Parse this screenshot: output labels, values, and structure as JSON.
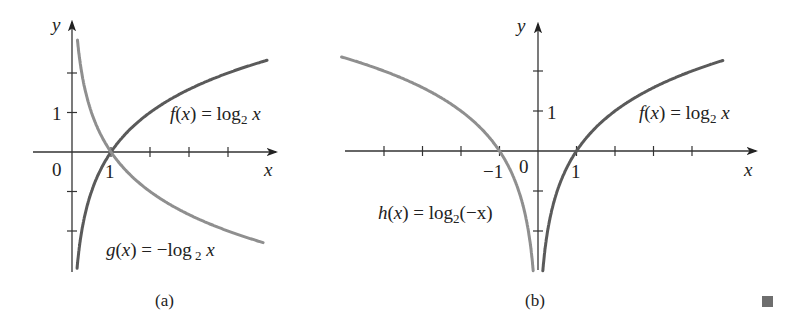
{
  "chart_data": [
    {
      "id": "a",
      "type": "line",
      "caption": "(a)",
      "xlabel": "x",
      "ylabel": "y",
      "origin_label": "0",
      "x_tick_labels": [
        {
          "x": 1,
          "label": "1"
        }
      ],
      "y_tick_labels": [
        {
          "y": 1,
          "label": "1"
        }
      ],
      "x_ticks": [
        1,
        2,
        3,
        4
      ],
      "y_ticks": [
        -2,
        -1,
        1,
        2
      ],
      "xlim": [
        -1,
        5.4
      ],
      "ylim": [
        -3,
        3
      ],
      "grid": false,
      "series": [
        {
          "name": "f(x) = log2 x",
          "expr": "log2(x)",
          "domain": [
            0.25,
            5
          ],
          "color": "#5a5a5a",
          "points": [
            [
              0.25,
              -2
            ],
            [
              0.5,
              -1
            ],
            [
              1,
              0
            ],
            [
              2,
              1
            ],
            [
              4,
              2
            ],
            [
              5,
              2.32
            ]
          ]
        },
        {
          "name": "g(x) = -log2 x",
          "expr": "-log2(x)",
          "domain": [
            0.25,
            5
          ],
          "color": "#8f8f8f",
          "points": [
            [
              0.25,
              2
            ],
            [
              0.5,
              1
            ],
            [
              1,
              0
            ],
            [
              2,
              -1
            ],
            [
              4,
              -2
            ],
            [
              5,
              -2.32
            ]
          ]
        }
      ],
      "annotations": [
        {
          "text": "f(x) = log₂ x",
          "near": [
            2.7,
            1
          ]
        },
        {
          "text": "g(x) = −log₂ x",
          "near": [
            1.5,
            -2.2
          ]
        }
      ]
    },
    {
      "id": "b",
      "type": "line",
      "caption": "(b)",
      "xlabel": "x",
      "ylabel": "y",
      "origin_label": "0",
      "x_tick_labels": [
        {
          "x": -1,
          "label": "−1"
        },
        {
          "x": 1,
          "label": "1"
        }
      ],
      "y_tick_labels": [
        {
          "y": 1,
          "label": "1"
        }
      ],
      "x_ticks": [
        -4,
        -3,
        -2,
        -1,
        1,
        2,
        3,
        4
      ],
      "y_ticks": [
        -2,
        -1,
        1,
        2
      ],
      "xlim": [
        -5.1,
        5.7
      ],
      "ylim": [
        -3,
        3
      ],
      "grid": false,
      "series": [
        {
          "name": "f(x) = log2 x",
          "expr": "log2(x)",
          "domain": [
            0.15,
            5
          ],
          "color": "#5a5a5a",
          "points": [
            [
              0.25,
              -2
            ],
            [
              0.5,
              -1
            ],
            [
              1,
              0
            ],
            [
              2,
              1
            ],
            [
              4,
              2
            ],
            [
              5,
              2.32
            ]
          ]
        },
        {
          "name": "h(x) = log2(-x)",
          "expr": "log2(-x)",
          "domain": [
            -5,
            -0.15
          ],
          "color": "#8f8f8f",
          "points": [
            [
              -5,
              2.32
            ],
            [
              -4,
              2
            ],
            [
              -2,
              1
            ],
            [
              -1,
              0
            ],
            [
              -0.5,
              -1
            ],
            [
              -0.25,
              -2
            ]
          ]
        }
      ],
      "annotations": [
        {
          "text": "f(x) = log₂ x",
          "near": [
            2.6,
            1
          ]
        },
        {
          "text": "h(x) = log₂(−x)",
          "near": [
            -3.5,
            -1.5
          ]
        }
      ]
    }
  ],
  "labels": {
    "a": {
      "y_axis": "y",
      "x_axis": "x",
      "origin": "0",
      "x_one": "1",
      "y_one": "1",
      "f_name": "f",
      "f_paren_open": "(",
      "f_var": "x",
      "f_paren_close": ")",
      "f_eq": " = log",
      "f_sub": "2",
      "f_arg": " x",
      "g_name": "g",
      "g_paren_open": "(",
      "g_var": "x",
      "g_paren_close": ")",
      "g_eq": " = −log",
      "g_sub": " 2",
      "g_arg": " x",
      "caption": "(a)"
    },
    "b": {
      "y_axis": "y",
      "x_axis": "x",
      "origin": "0",
      "x_neg_one": "−1",
      "x_one": "1",
      "y_one": "1",
      "f_name": "f",
      "f_paren_open": "(",
      "f_var": "x",
      "f_paren_close": ")",
      "f_eq": " = log",
      "f_sub": "2",
      "f_arg": " x",
      "h_name": "h",
      "h_paren_open": "(",
      "h_var": "x",
      "h_paren_close": ")",
      "h_eq": " = log",
      "h_sub": "2",
      "h_arg": "(−x)",
      "caption": "(b)"
    }
  },
  "end_mark": "end-of-proof-square",
  "colors": {
    "axis": "#333333",
    "curve_f": "#5a5a5a",
    "curve_reflected": "#8f8f8f",
    "end_mark": "#6e6e6e"
  }
}
